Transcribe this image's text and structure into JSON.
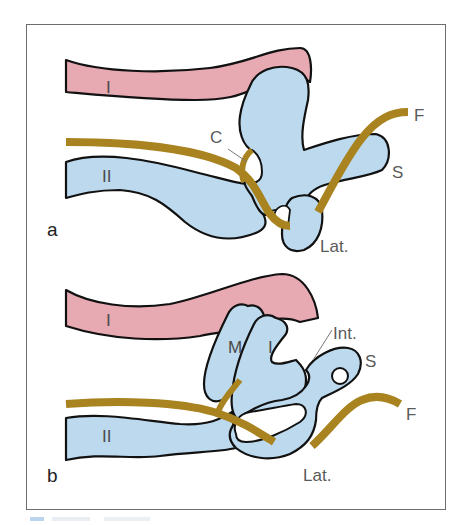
{
  "figure": {
    "colors": {
      "pink": "#e7a9b2",
      "blue": "#bcd9ee",
      "gold": "#a8831f",
      "outline": "#111111",
      "frame": "#6d6d6d",
      "label": "#5a5a5a"
    },
    "panels": [
      {
        "id": "a",
        "panel_label": "a",
        "labels": {
          "I": "I",
          "II": "II",
          "C": "C",
          "F": "F",
          "S": "S",
          "Lat": "Lat."
        }
      },
      {
        "id": "b",
        "panel_label": "b",
        "labels": {
          "I": "I",
          "II": "II",
          "M": "M",
          "I_inner": "I",
          "Int": "Int.",
          "S": "S",
          "F": "F",
          "Lat": "Lat."
        }
      }
    ]
  }
}
